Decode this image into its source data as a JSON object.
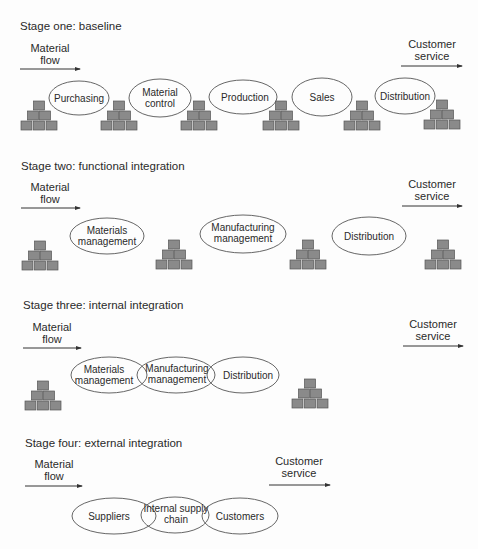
{
  "colors": {
    "background": "#fdfdfd",
    "text": "#2a2a2a",
    "inventory_box": "#8a8a8a",
    "outline": "#555555"
  },
  "common": {
    "material_flow": [
      "Material",
      "flow"
    ],
    "customer_service": [
      "Customer",
      "service"
    ]
  },
  "stages": [
    {
      "title": "Stage one: baseline",
      "functions": [
        {
          "lines": [
            "Purchasing"
          ]
        },
        {
          "lines": [
            "Material",
            "control"
          ]
        },
        {
          "lines": [
            "Production"
          ]
        },
        {
          "lines": [
            "Sales"
          ]
        },
        {
          "lines": [
            "Distribution"
          ]
        }
      ],
      "inventory_stacks": 6
    },
    {
      "title": "Stage two: functional integration",
      "functions": [
        {
          "lines": [
            "Materials",
            "management"
          ]
        },
        {
          "lines": [
            "Manufacturing",
            "management"
          ]
        },
        {
          "lines": [
            "Distribution"
          ]
        }
      ],
      "inventory_stacks": 4
    },
    {
      "title": "Stage three: internal integration",
      "functions": [
        {
          "lines": [
            "Materials",
            "management"
          ]
        },
        {
          "lines": [
            "Manufacturing",
            "management"
          ]
        },
        {
          "lines": [
            "Distribution"
          ]
        }
      ],
      "inventory_stacks": 2
    },
    {
      "title": "Stage four: external integration",
      "functions": [
        {
          "lines": [
            "Suppliers"
          ]
        },
        {
          "lines": [
            "Internal supply",
            "chain"
          ]
        },
        {
          "lines": [
            "Customers"
          ]
        }
      ],
      "inventory_stacks": 0
    }
  ]
}
